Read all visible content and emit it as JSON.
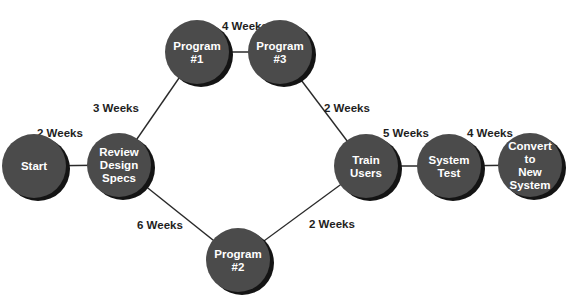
{
  "diagram": {
    "type": "PERT network",
    "colors": {
      "node_fill": "#4b4b4b",
      "node_shadow": "#141414",
      "text": "#ffffff",
      "edge": "#2a2a2a",
      "label": "#1e1e1e"
    },
    "node_radius": 32,
    "nodes": [
      {
        "id": "start",
        "lines": [
          "Start"
        ],
        "x": 34,
        "y": 166
      },
      {
        "id": "review",
        "lines": [
          "Review",
          "Design",
          "Specs"
        ],
        "x": 119,
        "y": 165
      },
      {
        "id": "program1",
        "lines": [
          "Program",
          "#1"
        ],
        "x": 197,
        "y": 52
      },
      {
        "id": "program3",
        "lines": [
          "Program",
          "#3"
        ],
        "x": 280,
        "y": 52
      },
      {
        "id": "program2",
        "lines": [
          "Program",
          "#2"
        ],
        "x": 238,
        "y": 260
      },
      {
        "id": "train",
        "lines": [
          "Train",
          "Users"
        ],
        "x": 366,
        "y": 166
      },
      {
        "id": "systest",
        "lines": [
          "System",
          "Test"
        ],
        "x": 449,
        "y": 166
      },
      {
        "id": "convert",
        "lines": [
          "Convert",
          "to",
          "New",
          "System"
        ],
        "x": 530,
        "y": 165
      }
    ],
    "edges": [
      {
        "from": "start",
        "to": "review",
        "label": "2 Weeks",
        "lx": 37,
        "ly": 127
      },
      {
        "from": "review",
        "to": "program1",
        "label": "3 Weeks",
        "lx": 93,
        "ly": 102
      },
      {
        "from": "program1",
        "to": "program3",
        "label": "4 Weeks",
        "lx": 222,
        "ly": 20
      },
      {
        "from": "program3",
        "to": "train",
        "label": "2 Weeks",
        "lx": 324,
        "ly": 102
      },
      {
        "from": "review",
        "to": "program2",
        "label": "6 Weeks",
        "lx": 137,
        "ly": 219
      },
      {
        "from": "program2",
        "to": "train",
        "label": "2 Weeks",
        "lx": 309,
        "ly": 218
      },
      {
        "from": "train",
        "to": "systest",
        "label": "5 Weeks",
        "lx": 383,
        "ly": 127
      },
      {
        "from": "systest",
        "to": "convert",
        "label": "4 Weeks",
        "lx": 467,
        "ly": 127
      }
    ]
  }
}
